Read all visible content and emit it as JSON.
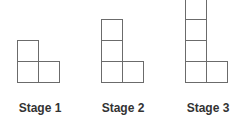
{
  "figure": {
    "type": "pattern-sequence",
    "stroke_color": "#6b6b6b",
    "label_color": "#333333",
    "stages": [
      {
        "label": "Stage 1",
        "column_height": 2,
        "bottom_row_width": 2,
        "total_squares": 3
      },
      {
        "label": "Stage 2",
        "column_height": 3,
        "bottom_row_width": 2,
        "total_squares": 4
      },
      {
        "label": "Stage 3",
        "column_height": 4,
        "bottom_row_width": 2,
        "total_squares": 5
      }
    ]
  }
}
